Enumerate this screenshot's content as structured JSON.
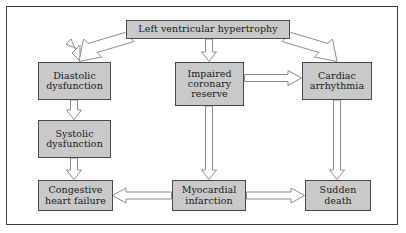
{
  "diagram": {
    "background_color": "#ffffff",
    "frame_color": "#3a3a3a",
    "node_fill_color": "#c9c9c9",
    "node_border_color": "#4a4a4a",
    "arrow_fill_color": "#ffffff",
    "arrow_outline_color": "#8d8d8d",
    "text_color": "#16191c",
    "nodes": [
      {
        "id": "lvh",
        "label": "Left ventricular hypertrophy"
      },
      {
        "id": "diastolic",
        "label": "Diastolic dysfunction"
      },
      {
        "id": "impaired",
        "label": "Impaired coronary reserve"
      },
      {
        "id": "cardiac",
        "label": "Cardiac arrhythmia"
      },
      {
        "id": "systolic",
        "label": "Systolic dysfunction"
      },
      {
        "id": "congestive",
        "label": "Congestive heart failure"
      },
      {
        "id": "myocardial",
        "label": "Myocardial infarction"
      },
      {
        "id": "sudden",
        "label": "Sudden death"
      }
    ],
    "edges": [
      {
        "from": "lvh",
        "to": "diastolic",
        "direction": "down-left"
      },
      {
        "from": "lvh",
        "to": "impaired",
        "direction": "down"
      },
      {
        "from": "lvh",
        "to": "cardiac",
        "direction": "down-right"
      },
      {
        "from": "diastolic",
        "to": "systolic",
        "direction": "down"
      },
      {
        "from": "systolic",
        "to": "congestive",
        "direction": "down"
      },
      {
        "from": "impaired",
        "to": "cardiac",
        "direction": "right"
      },
      {
        "from": "impaired",
        "to": "myocardial",
        "direction": "down"
      },
      {
        "from": "cardiac",
        "to": "sudden",
        "direction": "down"
      },
      {
        "from": "myocardial",
        "to": "congestive",
        "direction": "left"
      },
      {
        "from": "myocardial",
        "to": "sudden",
        "direction": "right"
      }
    ]
  }
}
